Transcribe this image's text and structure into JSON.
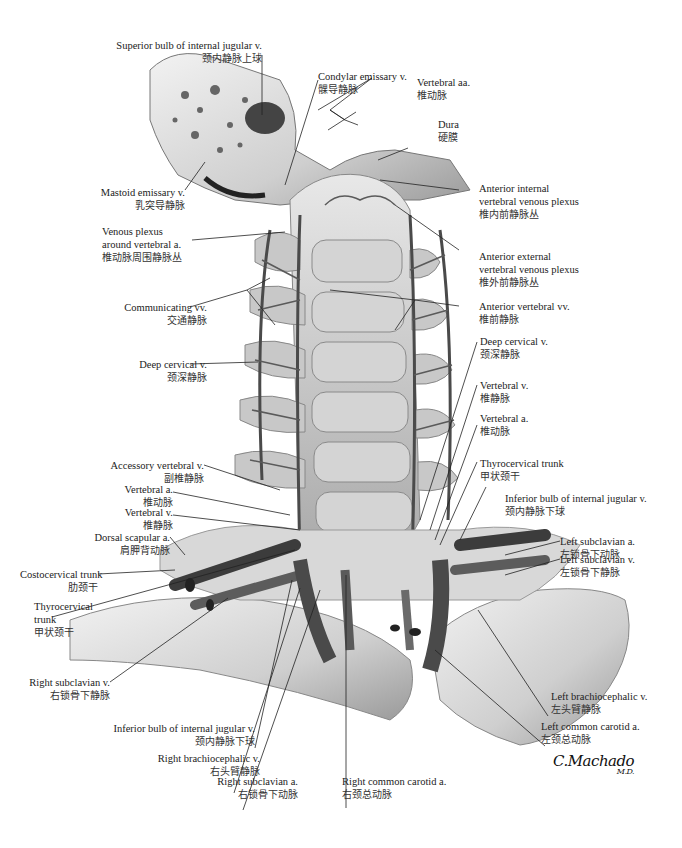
{
  "figure": {
    "signature": "C.Machado",
    "signature_sub": "M.D."
  },
  "labels": {
    "superior_bulb_ijv": {
      "en": "Superior bulb of internal jugular v.",
      "zh": "颈内静脉上球"
    },
    "condylar_emissary": {
      "en": "Condylar emissary v.",
      "zh": "髁导静脉"
    },
    "vertebral_aa": {
      "en": "Vertebral aa.",
      "zh": "椎动脉"
    },
    "dura": {
      "en": "Dura",
      "zh": "硬膜"
    },
    "mastoid_emissary": {
      "en": "Mastoid emissary v.",
      "zh": "乳突导静脉"
    },
    "anterior_internal_plexus": {
      "en1": "Anterior internal",
      "en2": "vertebral venous plexus",
      "zh": "椎内前静脉丛"
    },
    "venous_plexus_vertebral": {
      "en1": "Venous plexus",
      "en2": "around vertebral a.",
      "zh": "椎动脉周围静脉丛"
    },
    "anterior_external_plexus": {
      "en1": "Anterior external",
      "en2": "vertebral venous plexus",
      "zh": "椎外前静脉丛"
    },
    "communicating_vv": {
      "en": "Communicating vv.",
      "zh": "交通静脉"
    },
    "anterior_vertebral_vv": {
      "en": "Anterior vertebral vv.",
      "zh": "椎前静脉"
    },
    "deep_cervical_left": {
      "en": "Deep cervical v.",
      "zh": "颈深静脉"
    },
    "deep_cervical_right": {
      "en": "Deep cervical v.",
      "zh": "颈深静脉"
    },
    "vertebral_v_right": {
      "en": "Vertebral v.",
      "zh": "椎静脉"
    },
    "vertebral_a_right": {
      "en": "Vertebral a.",
      "zh": "椎动脉"
    },
    "accessory_vertebral": {
      "en": "Accessory vertebral v.",
      "zh": "副椎静脉"
    },
    "thyrocervical_right": {
      "en": "Thyrocervical trunk",
      "zh": "甲状颈干"
    },
    "vertebral_a_left": {
      "en": "Vertebral a.",
      "zh": "椎动脉"
    },
    "inferior_bulb_ijv_right": {
      "en": "Inferior bulb of internal jugular v.",
      "zh": "颈内静脉下球"
    },
    "vertebral_v_left": {
      "en": "Vertebral v.",
      "zh": "椎静脉"
    },
    "dorsal_scapular": {
      "en": "Dorsal scapular a.",
      "zh": "肩胛背动脉"
    },
    "left_subclavian_a": {
      "en": "Left subclavian a.",
      "zh": "左锁骨下动脉"
    },
    "left_subclavian_v": {
      "en": "Left subclavian v.",
      "zh": "左锁骨下静脉"
    },
    "costocervical": {
      "en": "Costocervical trunk",
      "zh": "肋颈干"
    },
    "thyrocervical_left": {
      "en1": "Thyrocervical",
      "en2": "trunk",
      "zh": "甲状颈干"
    },
    "right_subclavian_v": {
      "en": "Right subclavian v.",
      "zh": "右锁骨下静脉"
    },
    "left_brachiocephalic": {
      "en": "Left brachiocephalic v.",
      "zh": "左头臂静脉"
    },
    "inferior_bulb_ijv_left": {
      "en": "Inferior bulb of internal jugular v.",
      "zh": "颈内静脉下球"
    },
    "left_common_carotid": {
      "en": "Left common carotid a.",
      "zh": "左颈总动脉"
    },
    "right_brachiocephalic": {
      "en": "Right brachiocephalic v.",
      "zh": "右头臂静脉"
    },
    "right_subclavian_a": {
      "en": "Right subclavian a.",
      "zh": "右锁骨下动脉"
    },
    "right_common_carotid": {
      "en": "Right common carotid a.",
      "zh": "右颈总动脉"
    }
  }
}
